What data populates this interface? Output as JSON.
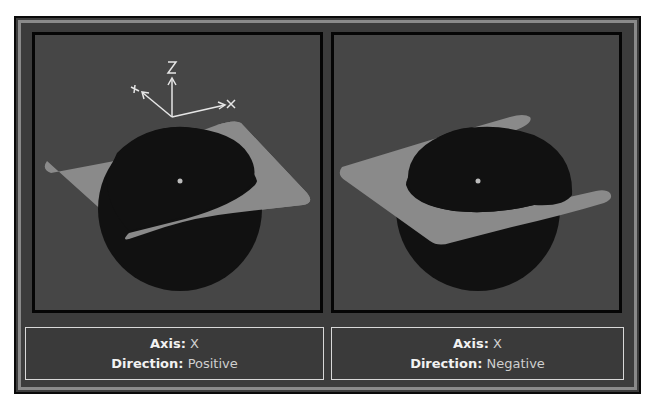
{
  "panels": [
    {
      "id": "left",
      "axis_label": "Axis:",
      "axis_value": "X",
      "direction_label": "Direction:",
      "direction_value": "Positive",
      "gizmo": {
        "x_label": "X",
        "y_label": "Y",
        "z_label": "Z"
      }
    },
    {
      "id": "right",
      "axis_label": "Axis:",
      "axis_value": "X",
      "direction_label": "Direction:",
      "direction_value": "Negative",
      "gizmo": {
        "x_label": "X",
        "y_label": "Y",
        "z_label": "Z"
      }
    }
  ],
  "colors": {
    "frame_bg": "#3c3c3c",
    "viewport_bg": "#464646",
    "sphere": "#111111",
    "plane": "#8a8a8a",
    "gizmo": "#e6e6e6",
    "caption_border": "#d8d8d8"
  }
}
